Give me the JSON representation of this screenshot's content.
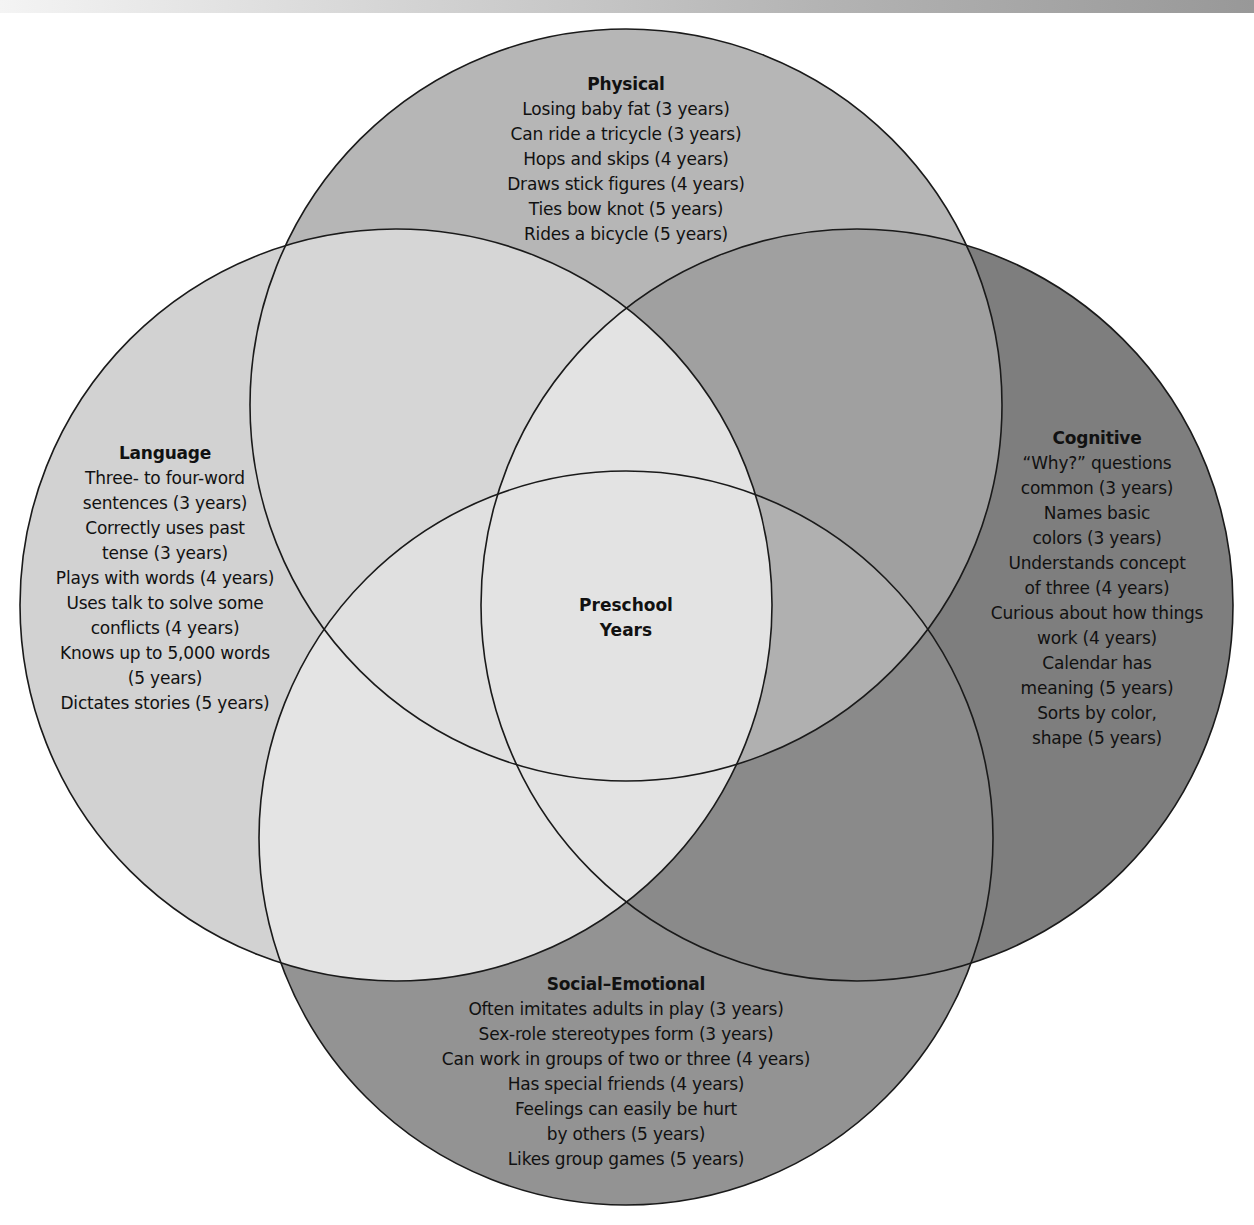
{
  "diagram": {
    "type": "venn",
    "center": {
      "lines": [
        "Preschool",
        "Years"
      ]
    },
    "colors": {
      "physical": "#b6b6b6",
      "language": "#d2d2d2",
      "cognitive": "#7e7e7e",
      "social_emotional": "#939393",
      "physical_language": "#d6d6d6",
      "physical_cognitive": "#a0a0a0",
      "language_social": "#e4e4e4",
      "cognitive_social": "#8a8a8a",
      "center": "#e3e3e3",
      "outline": "#1a1a1a"
    },
    "circles": {
      "physical": {
        "title": "Physical",
        "items": [
          "Losing baby fat (3 years)",
          "Can ride a tricycle (3 years)",
          "Hops and skips (4 years)",
          "Draws stick figures (4 years)",
          "Ties bow knot (5 years)",
          "Rides a bicycle (5 years)"
        ]
      },
      "language": {
        "title": "Language",
        "items": [
          "Three- to four-word",
          "sentences (3 years)",
          "Correctly uses past",
          "tense (3 years)",
          "Plays with words (4 years)",
          "Uses talk to solve some",
          "conflicts (4 years)",
          "Knows up to 5,000 words",
          "(5 years)",
          "Dictates stories (5 years)"
        ]
      },
      "cognitive": {
        "title": "Cognitive",
        "items": [
          "“Why?” questions",
          "common (3 years)",
          "Names basic",
          "colors (3 years)",
          "Understands concept",
          "of three (4 years)",
          "Curious about how things",
          "work (4 years)",
          "Calendar has",
          "meaning (5 years)",
          "Sorts by color,",
          "shape (5 years)"
        ]
      },
      "social_emotional": {
        "title": "Social–Emotional",
        "items": [
          "Often imitates adults in play (3 years)",
          "Sex-role stereotypes form (3 years)",
          "Can work in groups of two or three (4 years)",
          "Has special friends (4 years)",
          "Feelings can easily be hurt",
          "by others (5 years)",
          "Likes group games (5 years)"
        ]
      }
    }
  }
}
